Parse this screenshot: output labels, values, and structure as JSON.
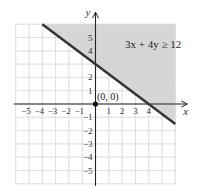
{
  "chart_data": {
    "type": "area",
    "title": "",
    "xlabel": "x",
    "ylabel": "y",
    "xlim": [
      -6,
      6
    ],
    "ylim": [
      -6,
      6
    ],
    "grid": true,
    "x_ticks": [
      -5,
      -4,
      -3,
      -2,
      -1,
      1,
      2,
      3,
      4
    ],
    "y_ticks": [
      -5,
      -4,
      -3,
      -2,
      -1,
      1,
      2,
      4,
      5
    ],
    "x_tick_labels": [
      "−5",
      "−4",
      "−3",
      "−2",
      "−1",
      "1",
      "2",
      "3",
      "4"
    ],
    "y_tick_labels": [
      "−5",
      "−4",
      "−3",
      "−2",
      "−1",
      "1",
      "2",
      "4",
      "5"
    ],
    "boundary_line": {
      "equation": "3x + 4y = 12",
      "style": "solid",
      "points": [
        [
          -4,
          6
        ],
        [
          6,
          -1.5
        ]
      ],
      "x_intercept": 4,
      "y_intercept": 3
    },
    "shaded_region": "3x + 4y ≥ 12",
    "annotations": [
      {
        "text": "3x + 4y ≥ 12",
        "x": 3.2,
        "y": 4.5
      },
      {
        "text": "(0, 0)",
        "x": 0.1,
        "y": 0.5,
        "marker": "point",
        "at": [
          0,
          0
        ]
      }
    ],
    "colors": {
      "shade": "#cfcfcf",
      "line": "#333333",
      "grid": "#d6d6d6",
      "axis": "#222222"
    }
  },
  "labels": {
    "x_axis": "x",
    "y_axis": "y",
    "inequality": "3x + 4y ≥ 12",
    "test_point": "(0, 0)"
  }
}
